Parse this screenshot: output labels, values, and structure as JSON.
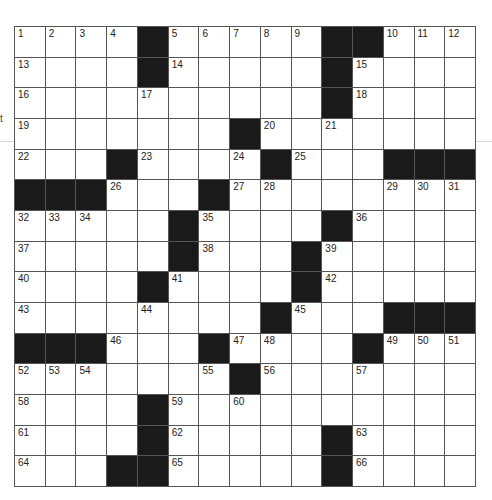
{
  "puzzle": {
    "rows": 15,
    "cols": 15,
    "margin_glyph": "t",
    "colors": {
      "block": "#1a1a1a",
      "cell": "#ffffff",
      "line": "#555555"
    },
    "grid": [
      [
        "1",
        "2",
        "3",
        "4",
        "#",
        "5",
        "6",
        "7",
        "8",
        "9",
        "#",
        "#",
        "10",
        "11",
        "12"
      ],
      [
        "13",
        "",
        "",
        "",
        "#",
        "14",
        "",
        "",
        "",
        "",
        "#",
        "15",
        "",
        "",
        ""
      ],
      [
        "16",
        "",
        "",
        "",
        "17",
        "",
        "",
        "",
        "",
        "",
        "#",
        "18",
        "",
        "",
        ""
      ],
      [
        "19",
        "",
        "",
        "",
        "",
        "",
        "",
        "#",
        "20",
        "",
        "21",
        "",
        "",
        "",
        ""
      ],
      [
        "22",
        "",
        "",
        "#",
        "23",
        "",
        "",
        "24",
        "#",
        "25",
        "",
        "",
        "#",
        "#",
        "#"
      ],
      [
        "#",
        "#",
        "#",
        "26",
        "",
        "",
        "#",
        "27",
        "28",
        "",
        "",
        "",
        "29",
        "30",
        "31"
      ],
      [
        "32",
        "33",
        "34",
        "",
        "",
        "#",
        "35",
        "",
        "",
        "",
        "#",
        "36",
        "",
        "",
        ""
      ],
      [
        "37",
        "",
        "",
        "",
        "",
        "#",
        "38",
        "",
        "",
        "#",
        "39",
        "",
        "",
        "",
        ""
      ],
      [
        "40",
        "",
        "",
        "",
        "#",
        "41",
        "",
        "",
        "",
        "#",
        "42",
        "",
        "",
        "",
        ""
      ],
      [
        "43",
        "",
        "",
        "",
        "44",
        "",
        "",
        "",
        "#",
        "45",
        "",
        "",
        "#",
        "#",
        "#"
      ],
      [
        "#",
        "#",
        "#",
        "46",
        "",
        "",
        "#",
        "47",
        "48",
        "",
        "",
        "#",
        "49",
        "50",
        "51"
      ],
      [
        "52",
        "53",
        "54",
        "",
        "",
        "",
        "55",
        "#",
        "56",
        "",
        "",
        "57",
        "",
        "",
        ""
      ],
      [
        "58",
        "",
        "",
        "",
        "#",
        "59",
        "",
        "60",
        "",
        "",
        "",
        "",
        "",
        "",
        ""
      ],
      [
        "61",
        "",
        "",
        "",
        "#",
        "62",
        "",
        "",
        "",
        "",
        "#",
        "63",
        "",
        "",
        ""
      ],
      [
        "64",
        "",
        "",
        "#",
        "#",
        "65",
        "",
        "",
        "",
        "",
        "#",
        "66",
        "",
        "",
        ""
      ]
    ]
  }
}
